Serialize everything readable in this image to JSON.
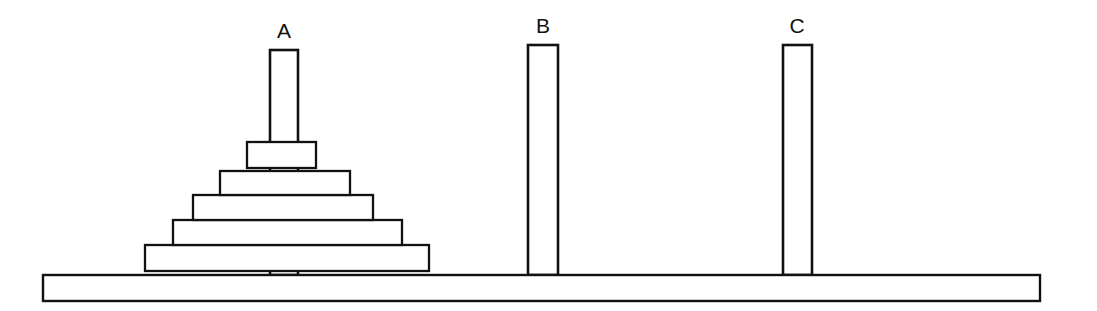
{
  "figure": {
    "type": "line-diagram",
    "background_color": "#ffffff",
    "line_color": "#111111",
    "fill_color": "#ffffff",
    "width": 1097,
    "height": 311
  },
  "base": {
    "name": "base-bar",
    "x": 43,
    "y": 275,
    "width": 997,
    "height": 26
  },
  "pegs": [
    {
      "id": "A",
      "label": "A",
      "label_x": 284,
      "label_y": 38,
      "x": 270,
      "y": 50,
      "width": 28,
      "height": 225,
      "disc_count": 5
    },
    {
      "id": "B",
      "label": "B",
      "label_x": 543,
      "label_y": 33,
      "x": 528,
      "y": 45,
      "width": 30,
      "height": 230,
      "disc_count": 0
    },
    {
      "id": "C",
      "label": "C",
      "label_x": 797,
      "label_y": 33,
      "x": 783,
      "y": 45,
      "width": 29,
      "height": 230,
      "disc_count": 0
    }
  ],
  "discs": [
    {
      "size": 5,
      "order_from_bottom": 1,
      "peg": "A",
      "x": 145,
      "y": 245,
      "width": 284,
      "height": 26
    },
    {
      "size": 4,
      "order_from_bottom": 2,
      "peg": "A",
      "x": 173,
      "y": 220,
      "width": 229,
      "height": 25
    },
    {
      "size": 3,
      "order_from_bottom": 3,
      "peg": "A",
      "x": 193,
      "y": 195,
      "width": 180,
      "height": 25
    },
    {
      "size": 2,
      "order_from_bottom": 4,
      "peg": "A",
      "x": 220,
      "y": 171,
      "width": 130,
      "height": 24
    },
    {
      "size": 1,
      "order_from_bottom": 5,
      "peg": "A",
      "x": 247,
      "y": 142,
      "width": 69,
      "height": 26
    }
  ]
}
